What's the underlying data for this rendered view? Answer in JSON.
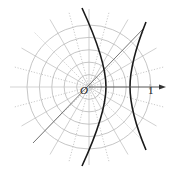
{
  "figure": {
    "type": "polar-coordinate-diagram",
    "origin_label": "O",
    "axis_tick_label": "1",
    "origin_px": [
      89,
      87
    ],
    "grid": {
      "circle_radii_px": [
        12.4,
        24.8,
        37.2,
        49.6,
        62
      ],
      "ray_count": 24,
      "ray_length_px": 78,
      "ray_styles": "alternating solid and dotted"
    },
    "colors": {
      "grid": "#b8b8b8",
      "curve": "#1a1a1a",
      "axis": "#555555",
      "asymptote": "#666666"
    },
    "curves": [
      {
        "name": "left-branch",
        "top": [
          82,
          8
        ],
        "vertex": [
          106,
          87
        ],
        "bottom": [
          82,
          164
        ]
      },
      {
        "name": "right-branch",
        "top": [
          146,
          22
        ],
        "vertex": [
          130,
          87
        ],
        "bottom": [
          146,
          150
        ]
      }
    ],
    "asymptote": {
      "from": [
        33,
        143
      ],
      "to": [
        144,
        28
      ]
    },
    "polar_axis": {
      "from": [
        89,
        87
      ],
      "to": [
        165,
        87
      ],
      "arrow": true
    }
  }
}
